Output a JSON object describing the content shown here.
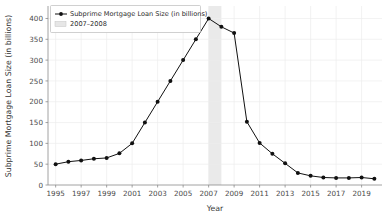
{
  "chart_data": {
    "type": "line",
    "title": "",
    "xlabel": "Year",
    "ylabel": "Subprime Mortgage Loan Size (in billions)",
    "xlim": [
      1994.4,
      2020.6
    ],
    "ylim": [
      0,
      430
    ],
    "grid": true,
    "legend_position": "upper left",
    "x": [
      1995,
      1996,
      1997,
      1998,
      1999,
      2000,
      2001,
      2002,
      2003,
      2004,
      2005,
      2006,
      2007,
      2008,
      2009,
      2010,
      2011,
      2012,
      2013,
      2014,
      2015,
      2016,
      2017,
      2018,
      2019,
      2020
    ],
    "series": [
      {
        "name": "Subprime Mortgage Loan Size (in billions)",
        "color": "#111111",
        "marker": "circle",
        "values": [
          50,
          56,
          59,
          63,
          65,
          76,
          100,
          150,
          200,
          250,
          300,
          350,
          400,
          380,
          365,
          152,
          101,
          75,
          52,
          29,
          22,
          18,
          17,
          17,
          18,
          15
        ]
      }
    ],
    "annotations": [
      {
        "type": "vspan",
        "label": "2007–2008",
        "x_start": 2007,
        "x_end": 2008,
        "color": "#e6e6e6"
      }
    ],
    "x_ticks": [
      1995,
      1997,
      1999,
      2001,
      2003,
      2005,
      2007,
      2009,
      2011,
      2013,
      2015,
      2017,
      2019
    ],
    "x_tick_labels": [
      "1995",
      "1997",
      "1999",
      "2001",
      "2003",
      "2005",
      "2007",
      "2009",
      "2011",
      "2013",
      "2015",
      "2017",
      "2019"
    ],
    "y_ticks": [
      0,
      50,
      100,
      150,
      200,
      250,
      300,
      350,
      400
    ],
    "y_tick_labels": [
      "0",
      "50",
      "100",
      "150",
      "200",
      "250",
      "300",
      "350",
      "400"
    ]
  },
  "legend": {
    "entries": [
      {
        "label": "Subprime Mortgage Loan Size (in billions)",
        "kind": "line-marker"
      },
      {
        "label": "2007–2008",
        "kind": "patch"
      }
    ]
  },
  "axes": {
    "x_title": "Year",
    "y_title": "Subprime Mortgage Loan Size (in billions)"
  }
}
